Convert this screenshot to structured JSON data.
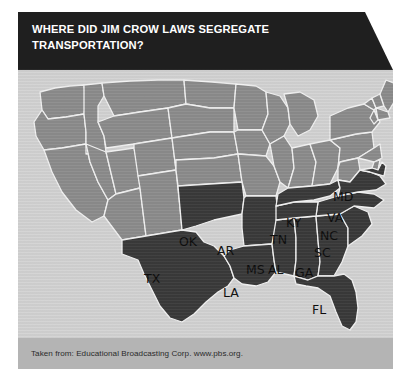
{
  "figure": {
    "title": "WHERE DID JIM CROW LAWS SEGREGATE\nTRANSPORTATION?",
    "caption": "Taken from: Educational Broadcasting Corp. www.pbs.org.",
    "colors": {
      "banner_background": "#1f1f1f",
      "banner_text": "#ffffff",
      "card_background": "#d3d3d3",
      "caption_band": "#b4b4b4",
      "caption_text": "#2b2b2b",
      "state_border": "#f2f2f2",
      "segregated_fill": "#3a3a3a",
      "non_segregated_fill": "#8c8c8c",
      "state_label_text": "#0d0d0d"
    }
  },
  "map": {
    "type": "choropleth",
    "region": "United States (contiguous 48 states)",
    "projection": "albers-usa",
    "categories": [
      {
        "key": "segregated",
        "fill": "#3a3a3a",
        "description": "States where Jim Crow laws segregated transportation"
      },
      {
        "key": "not_segregated",
        "fill": "#8c8c8c",
        "description": "States without transportation segregation laws shown"
      }
    ],
    "labeled_states": [
      {
        "abbr": "TX",
        "name": "Texas",
        "category": "segregated",
        "x": 126,
        "y": 203
      },
      {
        "abbr": "OK",
        "name": "Oklahoma",
        "category": "segregated",
        "x": 161,
        "y": 166
      },
      {
        "abbr": "AR",
        "name": "Arkansas",
        "category": "segregated",
        "x": 199,
        "y": 175
      },
      {
        "abbr": "LA",
        "name": "Louisiana",
        "category": "segregated",
        "x": 205,
        "y": 217
      },
      {
        "abbr": "MS",
        "name": "Mississippi",
        "category": "segregated",
        "x": 228,
        "y": 194
      },
      {
        "abbr": "AL",
        "name": "Alabama",
        "category": "segregated",
        "x": 250,
        "y": 194
      },
      {
        "abbr": "GA",
        "name": "Georgia",
        "category": "segregated",
        "x": 277,
        "y": 197
      },
      {
        "abbr": "FL",
        "name": "Florida",
        "category": "segregated",
        "x": 294,
        "y": 234
      },
      {
        "abbr": "SC",
        "name": "South Carolina",
        "category": "segregated",
        "x": 296,
        "y": 177
      },
      {
        "abbr": "NC",
        "name": "North Carolina",
        "category": "segregated",
        "x": 302,
        "y": 160
      },
      {
        "abbr": "TN",
        "name": "Tennessee",
        "category": "segregated",
        "x": 252,
        "y": 164
      },
      {
        "abbr": "KY",
        "name": "Kentucky",
        "category": "segregated",
        "x": 268,
        "y": 147
      },
      {
        "abbr": "VA",
        "name": "Virginia",
        "category": "segregated",
        "x": 309,
        "y": 142
      },
      {
        "abbr": "MD",
        "name": "Maryland",
        "category": "segregated",
        "x": 315,
        "y": 121
      }
    ]
  }
}
